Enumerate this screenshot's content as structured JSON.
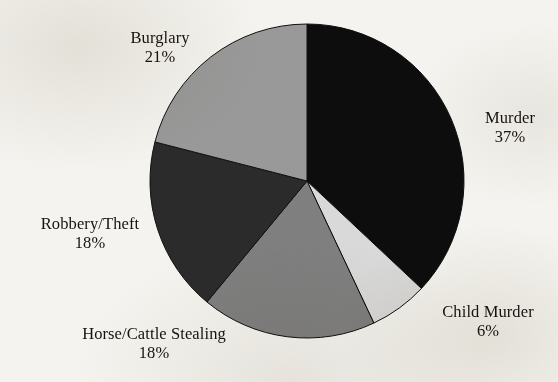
{
  "background_color": "#f4f3ef",
  "chart_data": {
    "type": "pie",
    "title": "",
    "subtitle": "",
    "xlabel": "",
    "ylabel": "",
    "legend_position": "none",
    "grid": false,
    "units": "percent",
    "start_angle_deg": 0,
    "direction": "clockwise",
    "center": {
      "x": 307,
      "y": 181
    },
    "radius": 157,
    "total": 100,
    "categories": [
      "Murder",
      "Child Murder",
      "Horse/Cattle Stealing",
      "Robbery/Theft",
      "Burglary"
    ],
    "values": [
      37,
      6,
      18,
      18,
      21
    ],
    "value_labels": [
      "37%",
      "6%",
      "18%",
      "18%",
      "21%"
    ],
    "colors": [
      "#0d0d0d",
      "#d9d9d9",
      "#7f7f7f",
      "#2b2b2b",
      "#999999"
    ],
    "slices": [
      {
        "name": "Murder",
        "value": 37,
        "value_label": "37%",
        "color": "#0d0d0d",
        "start_deg": 0,
        "end_deg": 133.2
      },
      {
        "name": "Child Murder",
        "value": 6,
        "value_label": "6%",
        "color": "#d9d9d9",
        "start_deg": 133.2,
        "end_deg": 154.8
      },
      {
        "name": "Horse/Cattle Stealing",
        "value": 18,
        "value_label": "18%",
        "color": "#7f7f7f",
        "start_deg": 154.8,
        "end_deg": 219.6
      },
      {
        "name": "Robbery/Theft",
        "value": 18,
        "value_label": "18%",
        "color": "#2b2b2b",
        "start_deg": 219.6,
        "end_deg": 284.4
      },
      {
        "name": "Burglary",
        "value": 21,
        "value_label": "21%",
        "color": "#999999",
        "start_deg": 284.4,
        "end_deg": 360
      }
    ]
  }
}
